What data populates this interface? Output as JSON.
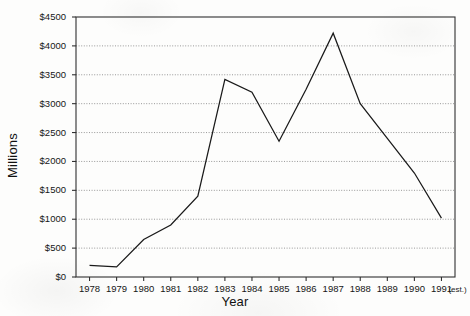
{
  "chart_data": {
    "type": "line",
    "title": "",
    "xlabel": "Year",
    "ylabel": "Millions",
    "x": [
      1978,
      1979,
      1980,
      1981,
      1982,
      1983,
      1984,
      1985,
      1986,
      1987,
      1988,
      1989,
      1990,
      1991
    ],
    "x_tick_labels": [
      "1978",
      "1979",
      "1980",
      "1981",
      "1982",
      "1983",
      "1984",
      "1985",
      "1986",
      "1987",
      "1988",
      "1989",
      "1990",
      "1991"
    ],
    "x_tick_annotation": "(est.)",
    "values": [
      200,
      175,
      650,
      900,
      1400,
      3420,
      3200,
      2350,
      3250,
      4220,
      3000,
      2400,
      1800,
      1020
    ],
    "series": [
      {
        "name": "Millions",
        "values": [
          200,
          175,
          650,
          900,
          1400,
          3420,
          3200,
          2350,
          3250,
          4220,
          3000,
          2400,
          1800,
          1020
        ]
      }
    ],
    "ylim": [
      0,
      4500
    ],
    "y_ticks": [
      0,
      500,
      1000,
      1500,
      2000,
      2500,
      3000,
      3500,
      4000,
      4500
    ],
    "y_tick_labels": [
      "$0",
      "$500",
      "$1000",
      "$1500",
      "$2000",
      "$2500",
      "$3000",
      "$3500",
      "$4000",
      "$4500"
    ],
    "grid": true,
    "grid_orientation": "horizontal",
    "grid_style": "dotted",
    "legend": false,
    "legend_position": "none",
    "line_color": "#1a1a1a",
    "background_color": "#ffffff",
    "frame": true,
    "markers": false
  }
}
